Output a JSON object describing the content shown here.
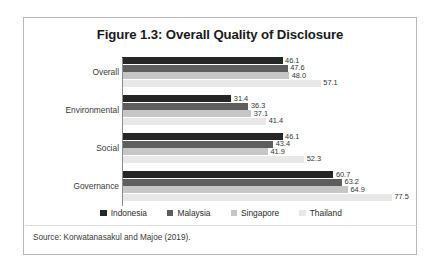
{
  "figure": {
    "title": "Figure 1.3: Overall Quality of Disclosure",
    "source": "Source: Korwatanasakul and Majoe (2019)."
  },
  "legend": {
    "position": "bottom-center",
    "items": [
      {
        "label": "Indonesia",
        "color": "#262626"
      },
      {
        "label": "Malaysia",
        "color": "#5e5e5e"
      },
      {
        "label": "Singapore",
        "color": "#c6c6c6"
      },
      {
        "label": "Thailand",
        "color": "#e8e8e8"
      }
    ]
  },
  "chart_data": {
    "type": "bar",
    "orientation": "horizontal",
    "title": "Figure 1.3: Overall Quality of Disclosure",
    "xlabel": "",
    "ylabel": "",
    "grid": false,
    "legend_position": "bottom-center",
    "axis_min": 0,
    "axis_max": 85,
    "categories": [
      "Overall",
      "Environmental",
      "Social",
      "Governance"
    ],
    "series": [
      {
        "name": "Indonesia",
        "color": "#262626",
        "values": [
          46.1,
          31.4,
          46.1,
          60.7
        ]
      },
      {
        "name": "Malaysia",
        "color": "#5e5e5e",
        "values": [
          47.6,
          36.3,
          43.4,
          63.2
        ]
      },
      {
        "name": "Singapore",
        "color": "#c6c6c6",
        "values": [
          48.0,
          37.1,
          41.9,
          64.9
        ]
      },
      {
        "name": "Thailand",
        "color": "#e8e8e8",
        "values": [
          57.1,
          41.4,
          52.3,
          77.5
        ]
      }
    ],
    "data_labels": {
      "Overall": [
        "46.1",
        "47.6",
        "48.0",
        "57.1"
      ],
      "Environmental": [
        "31.4",
        "36.3",
        "37.1",
        "41.4"
      ],
      "Social": [
        "46.1",
        "43.4",
        "41.9",
        "52.3"
      ],
      "Governance": [
        "60.7",
        "63.2",
        "64.9",
        "77.5"
      ]
    }
  }
}
